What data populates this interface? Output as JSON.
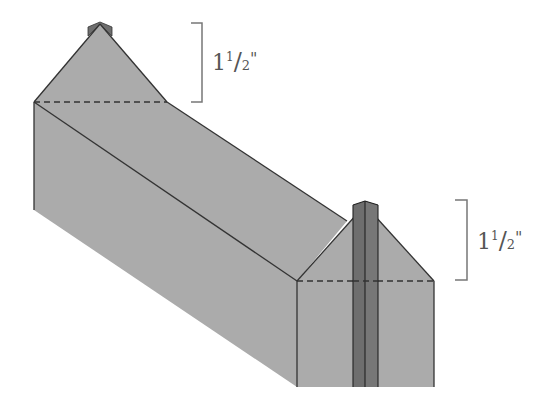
{
  "diagram": {
    "colors": {
      "background": "#ffffff",
      "body_fill": "#ababab",
      "chimney_fill": "#6e6e6e",
      "stroke": "#333333",
      "bracket": "#777777",
      "label": "#555555"
    },
    "dimensions": [
      {
        "id": "back-gable-height",
        "whole": "1",
        "numerator": "1",
        "slash": "/",
        "denominator": "2",
        "unit": "\""
      },
      {
        "id": "front-gable-height",
        "whole": "1",
        "numerator": "1",
        "slash": "/",
        "denominator": "2",
        "unit": "\""
      }
    ]
  }
}
